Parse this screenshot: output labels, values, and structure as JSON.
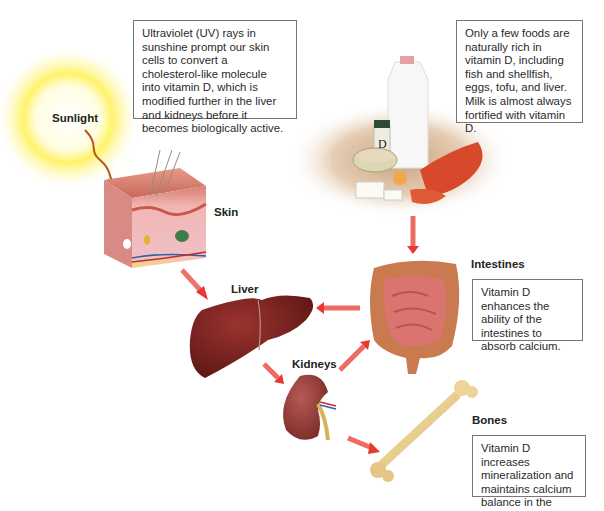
{
  "diagram": {
    "labels": {
      "sunlight": "Sunlight",
      "skin": "Skin",
      "liver": "Liver",
      "kidneys": "Kidneys",
      "intestines": "Intestines",
      "bones": "Bones",
      "supplement_letter": "D"
    },
    "callouts": {
      "uv": "Ultraviolet (UV) rays in sunshine prompt our skin cells to convert a cholesterol-like molecule into vitamin D, which is modified further in the liver and kidneys before it becomes biologically active.",
      "foods": "Only a few foods are naturally rich in vitamin D, including fish and shellfish, eggs, tofu, and liver. Milk is almost always fortified with vitamin D.",
      "intestines": "Vitamin D enhances the ability of the intestines to absorb calcium.",
      "bones": "Vitamin D increases mineralization and maintains calcium balance in the body."
    },
    "flow": [
      {
        "from": "sunlight",
        "to": "skin"
      },
      {
        "from": "skin",
        "to": "liver"
      },
      {
        "from": "foods",
        "to": "intestines"
      },
      {
        "from": "intestines",
        "to": "liver"
      },
      {
        "from": "liver",
        "to": "kidneys"
      },
      {
        "from": "kidneys",
        "to": "intestines"
      },
      {
        "from": "kidneys",
        "to": "bones"
      }
    ],
    "colors": {
      "arrow": "#e8382f",
      "sun": "#fff36a",
      "liver": "#7a1f1c",
      "kidney": "#9a3a36",
      "intestine": "#d9756e",
      "bone": "#e9cf8c",
      "callout_border": "#777777"
    }
  }
}
